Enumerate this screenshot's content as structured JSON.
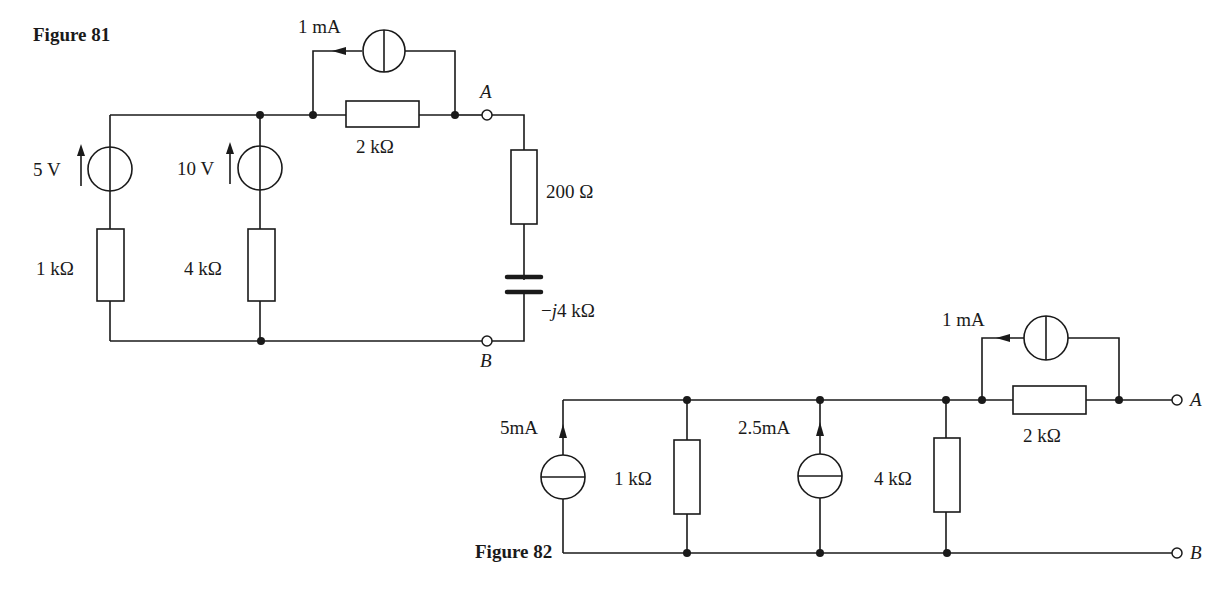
{
  "figures": [
    {
      "id": "figure-81",
      "caption": "Figure 81",
      "components": {
        "source_5v": {
          "type": "voltage-source",
          "label": "5 V"
        },
        "source_10v": {
          "type": "voltage-source",
          "label": "10 V"
        },
        "resistor_1k": {
          "type": "resistor",
          "label": "1 kΩ"
        },
        "resistor_4k": {
          "type": "resistor",
          "label": "4 kΩ"
        },
        "resistor_2k": {
          "type": "resistor",
          "label": "2 kΩ"
        },
        "current_source_1ma": {
          "type": "current-source",
          "label": "1 mA"
        },
        "resistor_200": {
          "type": "resistor",
          "label": "200 Ω"
        },
        "capacitor": {
          "type": "capacitor",
          "label_prefix": "−",
          "label_j": "j",
          "label_value": "4 kΩ"
        }
      },
      "terminals": {
        "a": "A",
        "b": "B"
      }
    },
    {
      "id": "figure-82",
      "caption": "Figure 82",
      "components": {
        "current_source_5ma": {
          "type": "current-source",
          "label": "5mA"
        },
        "resistor_1k": {
          "type": "resistor",
          "label": "1 kΩ"
        },
        "current_source_2_5ma": {
          "type": "current-source",
          "label": "2.5mA"
        },
        "resistor_4k": {
          "type": "resistor",
          "label": "4 kΩ"
        },
        "current_source_1ma": {
          "type": "current-source",
          "label": "1 mA"
        },
        "resistor_2k": {
          "type": "resistor",
          "label": "2 kΩ"
        }
      },
      "terminals": {
        "a": "A",
        "b": "B"
      }
    }
  ],
  "colors": {
    "ink": "#1a1a1a",
    "paper": "#ffffff"
  }
}
